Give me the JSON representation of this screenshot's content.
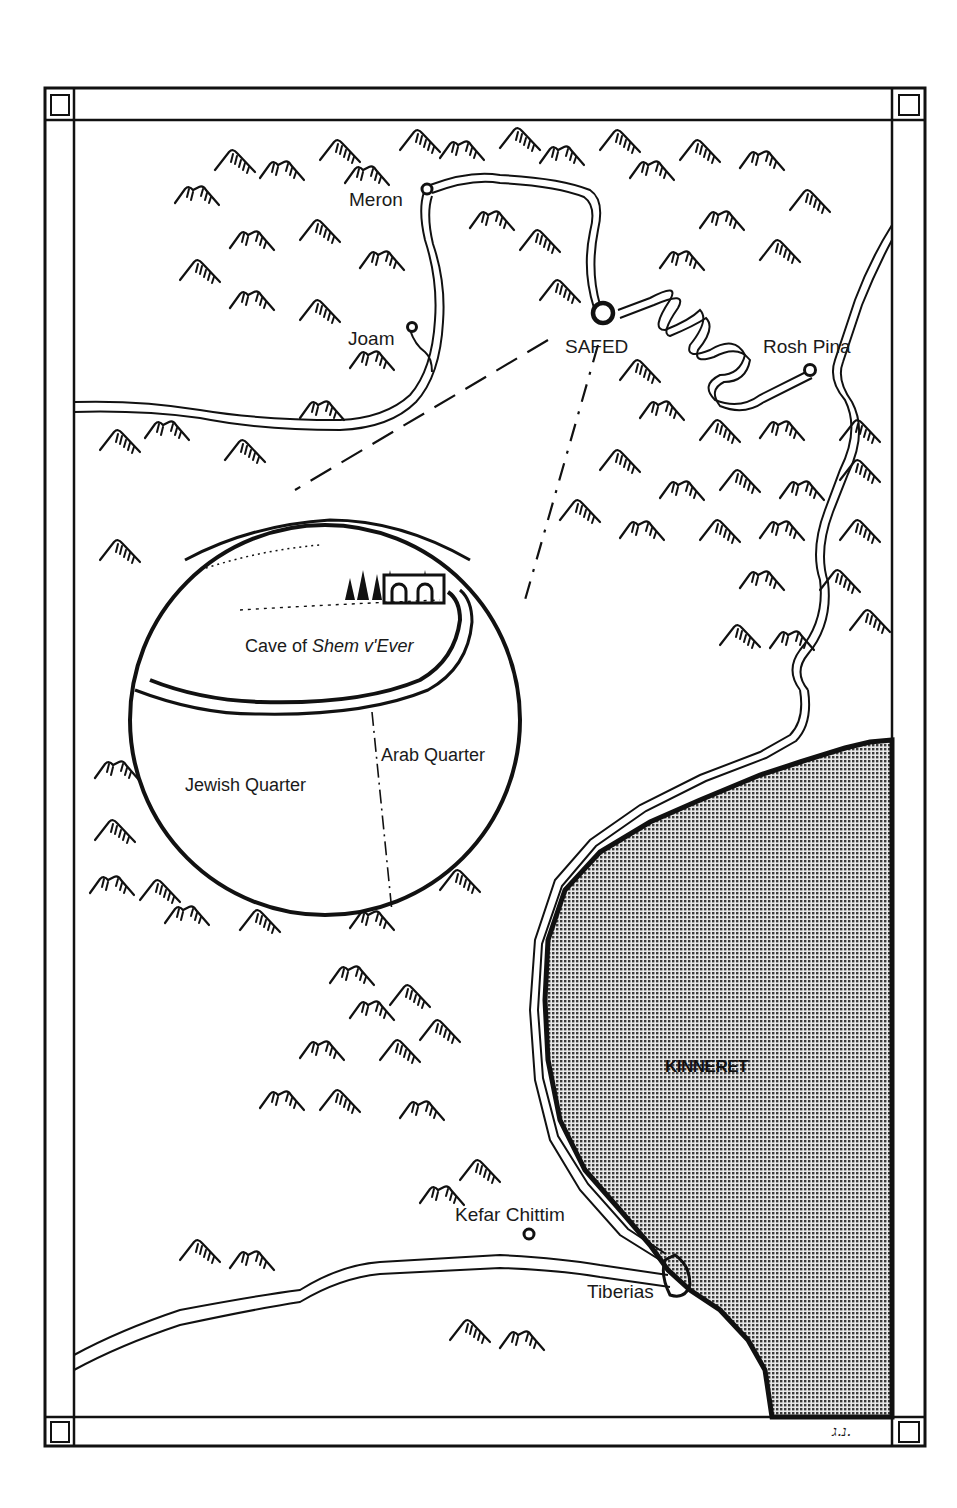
{
  "map": {
    "title": "Safed and the Galilee region",
    "colors": {
      "ink": "#111111",
      "paper": "#ffffff",
      "lake_fill": "#9a9a9a",
      "lake_dots": "#3a3a3a"
    },
    "places": [
      {
        "id": "meron",
        "label": "Meron",
        "type": "town"
      },
      {
        "id": "joam",
        "label": "Joam",
        "type": "town"
      },
      {
        "id": "safed",
        "label": "SAFED",
        "type": "city"
      },
      {
        "id": "rosh-pina",
        "label": "Rosh Pina",
        "type": "town"
      },
      {
        "id": "kefar-chittim",
        "label": "Kefar Chittim",
        "type": "town"
      },
      {
        "id": "tiberias",
        "label": "Tiberias",
        "type": "town"
      }
    ],
    "water": {
      "lake_label": "KINNERET"
    },
    "inset": {
      "cave_label_prefix": "Cave of ",
      "cave_label_italic": "Shem v'Ever",
      "quarters": [
        {
          "id": "jewish",
          "label": "Jewish Quarter"
        },
        {
          "id": "arab",
          "label": "Arab Quarter"
        }
      ]
    },
    "signature": "נ.ג."
  }
}
